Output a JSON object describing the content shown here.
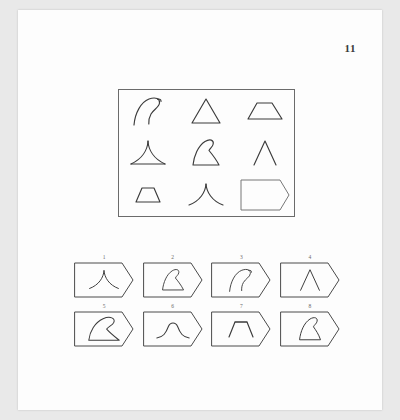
{
  "page": {
    "number": "11",
    "background_color": "#e9e9e9",
    "sheet_color": "#fdfdfd",
    "ink_color": "#3b3b3b",
    "type": "progressive-matrices-test-item"
  },
  "matrix": {
    "rows": 3,
    "columns": 3,
    "border_color": "#6b6b6b",
    "cells": [
      {
        "position": "r1c1",
        "shape": "wave-hook-curve",
        "label": "curved wave hook, concave-left, tip curls right"
      },
      {
        "position": "r1c2",
        "shape": "triangle",
        "label": "plain triangle with straight sides and base"
      },
      {
        "position": "r1c3",
        "shape": "trapezoid-wide",
        "label": "wide flat trapezoid"
      },
      {
        "position": "r2c1",
        "shape": "concave-spire-base",
        "label": "tall spire with concave sides and base line"
      },
      {
        "position": "r2c2",
        "shape": "fin-hook",
        "label": "fin with curled hook tip"
      },
      {
        "position": "r2c3",
        "shape": "caret",
        "label": "caret / chevron, no base line"
      },
      {
        "position": "r2c3b",
        "shape": "",
        "label": ""
      },
      {
        "position": "r3c1",
        "shape": "trapezoid-small",
        "label": "small trapezoid"
      },
      {
        "position": "r3c2",
        "shape": "concave-peak",
        "label": "peak with concave flaring sides, no base"
      },
      {
        "position": "r3c3",
        "shape": "answer-blank",
        "label": "blank tag-shaped answer space"
      }
    ],
    "answer_cell_position": "r3c3"
  },
  "options": {
    "count": 8,
    "rows": 2,
    "per_row": 4,
    "items": [
      {
        "number": "1",
        "shape": "concave-peak",
        "label": "peak with concave flaring sides"
      },
      {
        "number": "2",
        "shape": "fin-hook",
        "label": "small fin with curled hook tip"
      },
      {
        "number": "3",
        "shape": "wave-hook-curve",
        "label": "curved wave hook, tip curls right"
      },
      {
        "number": "4",
        "shape": "caret",
        "label": "caret / chevron"
      },
      {
        "number": "5",
        "shape": "fin-large",
        "label": "large fin, curl sweeping right"
      },
      {
        "number": "6",
        "shape": "bell-hump",
        "label": "rounded bell / hump with flared tails"
      },
      {
        "number": "7",
        "shape": "trapezoid-small",
        "label": "small trapezoid"
      },
      {
        "number": "8",
        "shape": "fin-hook-thick",
        "label": "fin with curled hook tip, upright"
      }
    ]
  }
}
